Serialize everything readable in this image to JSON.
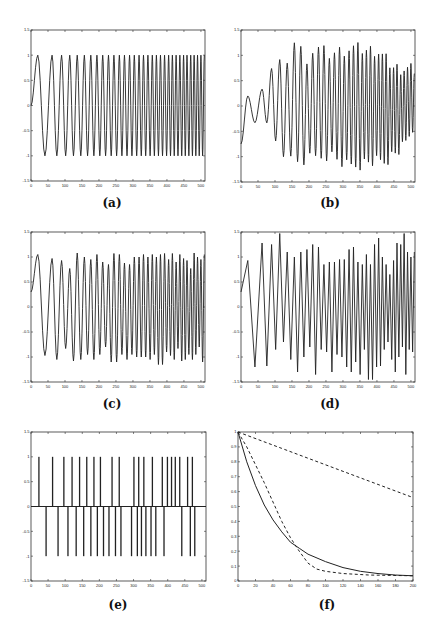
{
  "figure": {
    "panels": [
      {
        "id": "a",
        "caption": "(a)"
      },
      {
        "id": "b",
        "caption": "(b)"
      },
      {
        "id": "c",
        "caption": "(c)"
      },
      {
        "id": "d",
        "caption": "(d)"
      },
      {
        "id": "e",
        "caption": "(e)"
      },
      {
        "id": "f",
        "caption": "(f)"
      }
    ]
  },
  "chart_data": [
    {
      "id": "a",
      "type": "line",
      "title": "",
      "caption": "(a)",
      "description": "Chirp signal, amplitude 1, frequency increasing with time",
      "xlim": [
        0,
        512
      ],
      "ylim": [
        -1.5,
        1.5
      ],
      "xticks": [
        0,
        50,
        100,
        150,
        200,
        250,
        300,
        350,
        400,
        450,
        500
      ],
      "yticks": [
        -1.5,
        -1,
        -0.5,
        0,
        0.5,
        1,
        1.5
      ],
      "amplitude": 1.0,
      "peaks_x": [
        20,
        62,
        90,
        114,
        136,
        157,
        176,
        194,
        211,
        228,
        244,
        260,
        275,
        290,
        304,
        318,
        331,
        344,
        357,
        369,
        381,
        393,
        405,
        416,
        427,
        438,
        449,
        459,
        470,
        480,
        490,
        500,
        510
      ],
      "grid": false
    },
    {
      "id": "b",
      "type": "line",
      "title": "",
      "caption": "(b)",
      "description": "Noisy / reconstructed chirp with growing then varying amplitude",
      "xlim": [
        0,
        512
      ],
      "ylim": [
        -1.5,
        1.5
      ],
      "xticks": [
        0,
        50,
        100,
        150,
        200,
        250,
        300,
        350,
        400,
        450,
        500
      ],
      "yticks": [
        -1.5,
        -1,
        -0.5,
        0,
        0.5,
        1,
        1.5
      ],
      "peak_envelope": [
        {
          "x": 5,
          "y": 0.3
        },
        {
          "x": 18,
          "y": 0.33
        },
        {
          "x": 40,
          "y": 0.2
        },
        {
          "x": 68,
          "y": 0.42
        },
        {
          "x": 90,
          "y": 0.7
        },
        {
          "x": 115,
          "y": 0.8
        },
        {
          "x": 140,
          "y": 0.95
        },
        {
          "x": 160,
          "y": 1.3
        },
        {
          "x": 190,
          "y": 0.92
        },
        {
          "x": 220,
          "y": 1.15
        },
        {
          "x": 260,
          "y": 1.02
        },
        {
          "x": 290,
          "y": 1.08
        },
        {
          "x": 330,
          "y": 1.15
        },
        {
          "x": 370,
          "y": 1.1
        },
        {
          "x": 400,
          "y": 1.1
        },
        {
          "x": 450,
          "y": 0.75
        },
        {
          "x": 500,
          "y": 0.72
        }
      ],
      "trough_envelope": [
        {
          "x": 3,
          "y": -0.75
        },
        {
          "x": 60,
          "y": -0.3
        },
        {
          "x": 82,
          "y": -0.4
        },
        {
          "x": 110,
          "y": -0.75
        },
        {
          "x": 150,
          "y": -1.1
        },
        {
          "x": 175,
          "y": -1.1
        },
        {
          "x": 260,
          "y": -0.95
        },
        {
          "x": 315,
          "y": -1.2
        },
        {
          "x": 380,
          "y": -1.1
        },
        {
          "x": 420,
          "y": -1.1
        },
        {
          "x": 480,
          "y": -0.8
        },
        {
          "x": 505,
          "y": -0.4
        }
      ],
      "grid": false
    },
    {
      "id": "c",
      "type": "line",
      "title": "",
      "caption": "(c)",
      "description": "Reconstructed chirp, amplitude ~0.75–1.1",
      "xlim": [
        0,
        512
      ],
      "ylim": [
        -1.5,
        1.5
      ],
      "xticks": [
        0,
        50,
        100,
        150,
        200,
        250,
        300,
        350,
        400,
        450,
        500
      ],
      "yticks": [
        -1.5,
        -1,
        -0.5,
        0,
        0.5,
        1,
        1.5
      ],
      "peak_values": [
        1.05,
        0.97,
        0.93,
        0.77,
        1.08,
        1.0,
        0.95,
        1.05,
        0.9,
        0.85,
        1.07,
        1.05,
        0.88,
        0.85,
        1.0,
        1.0,
        1.05,
        1.0,
        1.05,
        1.0,
        1.05,
        1.07,
        0.95,
        1.07,
        0.9
      ],
      "trough_values": [
        -0.97,
        -1.05,
        -0.83,
        -1.08,
        -1.05,
        -0.95,
        -1.05,
        -0.95,
        -0.8,
        -1.1,
        -1.1,
        -0.95,
        -1.05,
        -0.95,
        -1.0,
        -1.0,
        -1.0,
        -1.05,
        -0.95,
        -1.15,
        -1.15,
        -0.9
      ],
      "grid": false
    },
    {
      "id": "d",
      "type": "line",
      "title": "",
      "caption": "(d)",
      "description": "Reconstructed chirp with sharper, irregular peaks",
      "xlim": [
        0,
        512
      ],
      "ylim": [
        -1.5,
        1.5
      ],
      "xticks": [
        0,
        50,
        100,
        150,
        200,
        250,
        300,
        350,
        400,
        450,
        500
      ],
      "yticks": [
        -1.5,
        -1,
        -0.5,
        0,
        0.5,
        1,
        1.5
      ],
      "peak_values": [
        0.93,
        1.28,
        1.25,
        1.47,
        1.1,
        1.0,
        1.1,
        1.15,
        1.25,
        1.2,
        0.85,
        0.9,
        0.9,
        0.95,
        0.95,
        1.15,
        1.2,
        0.9,
        0.85,
        1.05,
        0.85,
        1.25,
        1.38,
        1.0,
        0.85,
        0.65
      ],
      "trough_values": [
        -1.2,
        -1.18,
        -0.85,
        -0.7,
        -1.05,
        -1.3,
        -1.0,
        -0.8,
        -1.35,
        -0.85,
        -0.9,
        -1.3,
        -0.95,
        -1.0,
        -1.2,
        -1.3,
        -1.1,
        -1.35,
        -0.85,
        -1.45,
        -1.45
      ],
      "grid": false
    },
    {
      "id": "e",
      "type": "line",
      "title": "",
      "caption": "(e)",
      "description": "Sparse spike train with values ±1",
      "xlim": [
        0,
        512
      ],
      "ylim": [
        -1.5,
        1.5
      ],
      "xticks": [
        0,
        50,
        100,
        150,
        200,
        250,
        300,
        350,
        400,
        450,
        500
      ],
      "yticks": [
        -1.5,
        -1,
        -0.5,
        0,
        0.5,
        1,
        1.5
      ],
      "positive_spikes_x": [
        23,
        63,
        96,
        120,
        142,
        163,
        184,
        203,
        237,
        258,
        301,
        315,
        330,
        355,
        384,
        399,
        411,
        422,
        435,
        458,
        472
      ],
      "negative_spikes_x": [
        44,
        79,
        108,
        132,
        154,
        175,
        194,
        212,
        228,
        247,
        263,
        294,
        311,
        323,
        336,
        351,
        365,
        389,
        441,
        466,
        479
      ],
      "grid": false
    },
    {
      "id": "f",
      "type": "line",
      "title": "",
      "caption": "(f)",
      "description": "Three decay curves: one solid, two dashed",
      "xlim": [
        0,
        200
      ],
      "ylim": [
        0,
        1
      ],
      "xticks": [
        0,
        20,
        40,
        60,
        80,
        100,
        120,
        140,
        160,
        180,
        200
      ],
      "yticks": [
        0,
        0.1,
        0.2,
        0.3,
        0.4,
        0.5,
        0.6,
        0.7,
        0.8,
        0.9,
        1
      ],
      "series": [
        {
          "name": "solid",
          "style": "solid",
          "x": [
            0,
            10,
            20,
            30,
            40,
            50,
            60,
            70,
            80,
            100,
            120,
            140,
            160,
            180,
            200
          ],
          "y": [
            1.0,
            0.8,
            0.64,
            0.51,
            0.41,
            0.33,
            0.26,
            0.22,
            0.18,
            0.13,
            0.09,
            0.065,
            0.05,
            0.04,
            0.035
          ]
        },
        {
          "name": "dashed-upper",
          "style": "dashed",
          "x": [
            0,
            50,
            100,
            150,
            200
          ],
          "y": [
            1.0,
            0.89,
            0.78,
            0.67,
            0.56
          ]
        },
        {
          "name": "dashed-lower",
          "style": "dashed",
          "x": [
            0,
            10,
            20,
            30,
            40,
            50,
            60,
            70,
            80,
            90,
            100,
            120,
            150,
            200
          ],
          "y": [
            1.0,
            0.9,
            0.78,
            0.66,
            0.53,
            0.4,
            0.29,
            0.2,
            0.12,
            0.08,
            0.065,
            0.05,
            0.04,
            0.035
          ]
        }
      ],
      "grid": false
    }
  ]
}
